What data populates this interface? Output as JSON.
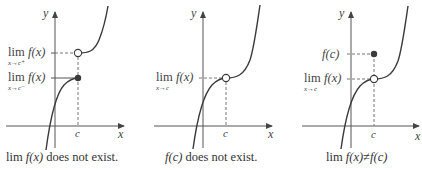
{
  "panels": [
    {
      "id": "panel-1",
      "axis_x_label": "x",
      "axis_y_label": "y",
      "c_label": "c",
      "labels": [
        {
          "lim": "lim",
          "sub": "x→c⁺",
          "func": "f(x)"
        },
        {
          "lim": "lim",
          "sub": "x→c⁻",
          "func": "f(x)"
        }
      ],
      "caption_lim": "lim",
      "caption_func": "f(x)",
      "caption_rest": " does not exist."
    },
    {
      "id": "panel-2",
      "axis_x_label": "x",
      "axis_y_label": "y",
      "c_label": "c",
      "labels": [
        {
          "lim": "lim",
          "sub": "x→c",
          "func": "f(x)"
        }
      ],
      "caption_func": "f(c)",
      "caption_rest": " does not exist."
    },
    {
      "id": "panel-3",
      "axis_x_label": "x",
      "axis_y_label": "y",
      "c_label": "c",
      "labels": [
        {
          "func": "f(c)"
        },
        {
          "lim": "lim",
          "sub": "x→c",
          "func": "f(x)"
        }
      ],
      "caption_lim": "lim",
      "caption_func": "f(x)",
      "caption_neq": "≠",
      "caption_func2": "f(c)"
    }
  ],
  "colors": {
    "curve": "#3a3a3a",
    "axis": "#555555",
    "dash": "#777777",
    "text": "#444444"
  }
}
